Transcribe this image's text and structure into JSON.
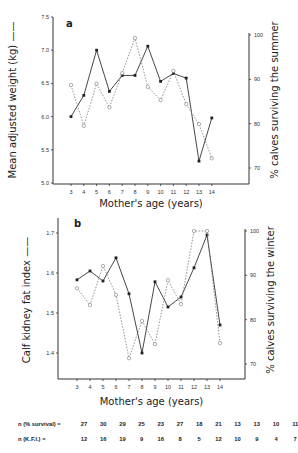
{
  "chart_data": [
    {
      "type": "line",
      "panel": "a",
      "xlabel": "Mother's age (years)",
      "ylabel": "Mean adjusted weight (kg)",
      "y2label": "% calves surviving the summer",
      "x": [
        3,
        4,
        5,
        6,
        7,
        8,
        9,
        10,
        11,
        12,
        13,
        14
      ],
      "ylim": [
        5.0,
        7.5
      ],
      "yticks": [
        "5.0",
        "5.5",
        "6.0",
        "6.5",
        "7.0",
        "7.5"
      ],
      "y2lim": [
        70,
        100
      ],
      "y2ticks": [
        "70",
        "80",
        "90",
        "100"
      ],
      "series": [
        {
          "name": "Mean adjusted weight (kg)",
          "style": "solid",
          "marker": "filled-square",
          "axis": "left",
          "values": [
            6.0,
            6.32,
            7.0,
            6.38,
            6.62,
            6.62,
            7.06,
            6.53,
            6.65,
            6.58,
            5.33,
            5.98
          ]
        },
        {
          "name": "% calves surviving the summer",
          "style": "dashed",
          "marker": "open-circle",
          "axis": "right",
          "values": [
            88.7,
            79.5,
            89.0,
            83.7,
            91.4,
            99.3,
            88.3,
            85.3,
            91.9,
            84.4,
            79.9,
            72.2
          ]
        }
      ],
      "grid": false
    },
    {
      "type": "line",
      "panel": "b",
      "xlabel": "Mother's age (years)",
      "ylabel": "Calf kidney fat index",
      "y2label": "% calves surviving the winter",
      "x": [
        3,
        4,
        5,
        6,
        7,
        8,
        9,
        10,
        11,
        12,
        13,
        14
      ],
      "ylim": [
        1.34,
        1.74
      ],
      "yticks": [
        "1.4",
        "1.5",
        "1.6",
        "1.7"
      ],
      "y2lim": [
        70,
        100
      ],
      "y2ticks": [
        "70",
        "80",
        "90",
        "100"
      ],
      "series": [
        {
          "name": "Calf kidney fat index",
          "style": "solid",
          "marker": "filled-square",
          "axis": "left",
          "values": [
            1.583,
            1.605,
            1.58,
            1.638,
            1.548,
            1.4,
            1.578,
            1.515,
            1.54,
            1.613,
            1.695,
            1.47
          ]
        },
        {
          "name": "% calves surviving the winter",
          "style": "dashed",
          "marker": "open-circle",
          "axis": "right",
          "values": [
            87.1,
            83.3,
            92.1,
            85.6,
            71.3,
            79.7,
            74.5,
            88.9,
            83.5,
            100,
            100,
            74.7
          ]
        }
      ],
      "grid": false
    }
  ],
  "panels": {
    "a": {
      "letter": "a",
      "ylabel": "Mean adjusted weight (kg) ——",
      "y2label": "% calves surviving the summer",
      "xlabel": "Mother's age (years)"
    },
    "b": {
      "letter": "b",
      "ylabel": "Calf kidney fat index ——",
      "y2label": "% calves surviving the winter",
      "xlabel": "Mother's age (years)"
    }
  },
  "sample_sizes": {
    "survival": {
      "label": "n  (% survival) =",
      "values": [
        "27",
        "30",
        "29",
        "25",
        "23",
        "27",
        "18",
        "21",
        "13",
        "13",
        "10",
        "11"
      ]
    },
    "kfi": {
      "label": "n  (K.F.I.)        =",
      "values": [
        "12",
        "16",
        "19",
        "9",
        "16",
        "8",
        "5",
        "12",
        "10",
        "9",
        "4",
        "7"
      ]
    }
  }
}
